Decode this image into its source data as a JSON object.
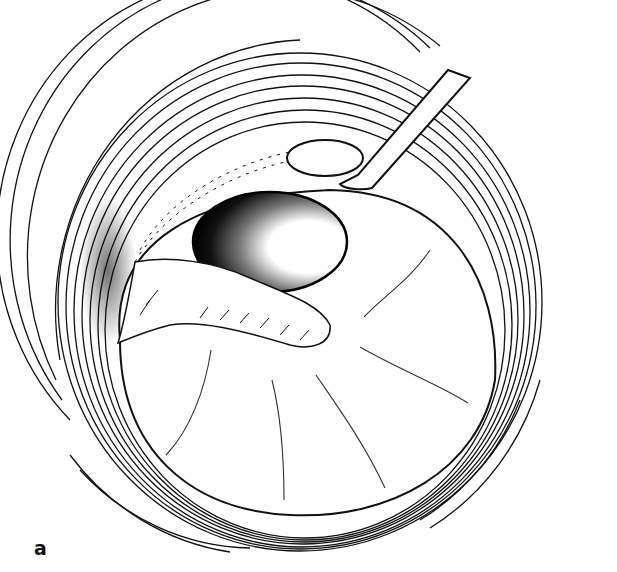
{
  "figure": {
    "panel_label": "a",
    "colors": {
      "line": "#111111",
      "background": "#ffffff"
    }
  }
}
